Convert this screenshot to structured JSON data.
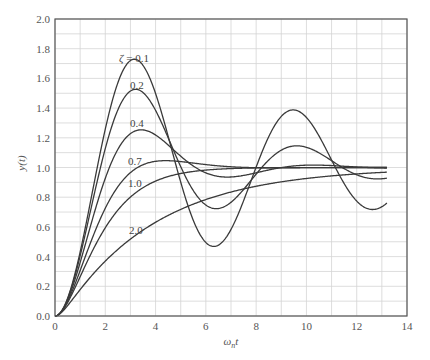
{
  "chart_data": {
    "type": "line",
    "title": "",
    "xlabel": "ωnt",
    "xlabel_base": "ω",
    "xlabel_sub": "n",
    "xlabel_tail": "t",
    "ylabel": "y(t)",
    "xlim": [
      0,
      14
    ],
    "ylim": [
      0,
      2.0
    ],
    "xticks": [
      "0",
      "2",
      "4",
      "6",
      "8",
      "10",
      "12",
      "14"
    ],
    "yticks": [
      "0.0",
      "0.2",
      "0.4",
      "0.6",
      "0.8",
      "1.0",
      "1.2",
      "1.4",
      "1.6",
      "1.8",
      "2.0"
    ],
    "grid": true,
    "grid_step": {
      "x": 1,
      "y": 0.1
    },
    "legend": "none (inline curve labels)",
    "t_end": 13.2,
    "x": [
      0,
      1,
      2,
      3,
      4,
      5,
      6,
      7,
      8,
      9,
      10,
      11,
      12,
      13
    ],
    "series": [
      {
        "name": "ζ = 0.1",
        "zeta": 0.1,
        "label": "ζ = 0.1",
        "label_pos": [
          119,
          62
        ],
        "values": [
          0.0,
          0.431,
          1.259,
          1.72,
          1.497,
          0.901,
          0.495,
          0.585,
          1.003,
          1.32,
          1.337,
          1.05,
          0.774,
          0.736
        ]
      },
      {
        "name": "ζ = 0.2",
        "zeta": 0.2,
        "label": "0.2",
        "label_pos": [
          130,
          89
        ],
        "values": [
          0.0,
          0.405,
          1.128,
          1.516,
          1.385,
          1.006,
          0.748,
          0.766,
          0.956,
          1.117,
          1.136,
          1.046,
          0.951,
          0.924
        ]
      },
      {
        "name": "ζ = 0.4",
        "zeta": 0.4,
        "label": "0.4",
        "label_pos": [
          130,
          127
        ],
        "values": [
          0.0,
          0.36,
          0.927,
          1.228,
          1.219,
          1.076,
          0.963,
          0.936,
          0.964,
          1.0,
          1.017,
          1.01,
          1.002,
          1.0
        ]
      },
      {
        "name": "ζ = 0.7",
        "zeta": 0.7,
        "label": "0.7",
        "label_pos": [
          128,
          165
        ],
        "values": [
          0.0,
          0.306,
          0.726,
          0.965,
          1.042,
          1.04,
          1.02,
          1.005,
          1.0,
          1.0,
          1.0,
          1.0,
          1.0,
          1.0
        ]
      },
      {
        "name": "ζ = 1.0",
        "zeta": 1.0,
        "label": "1.0",
        "label_pos": [
          128,
          187
        ],
        "values": [
          0.0,
          0.264,
          0.594,
          0.801,
          0.908,
          0.96,
          0.983,
          0.993,
          0.997,
          0.999,
          1.0,
          1.0,
          1.0,
          1.0
        ]
      },
      {
        "name": "ζ = 2.0",
        "zeta": 2.0,
        "label": "2.0",
        "label_pos": [
          129,
          234
        ],
        "values": [
          0.0,
          0.178,
          0.37,
          0.518,
          0.631,
          0.718,
          0.784,
          0.835,
          0.874,
          0.903,
          0.926,
          0.943,
          0.957,
          0.967
        ]
      }
    ]
  },
  "style": {
    "curve_color": "#3a3a3a",
    "grid_color": "#d4d4d4",
    "axis_color": "#555555",
    "background": "#ffffff"
  },
  "layout": {
    "plot_left": 55,
    "plot_top": 19,
    "plot_right": 407,
    "plot_bottom": 316
  }
}
